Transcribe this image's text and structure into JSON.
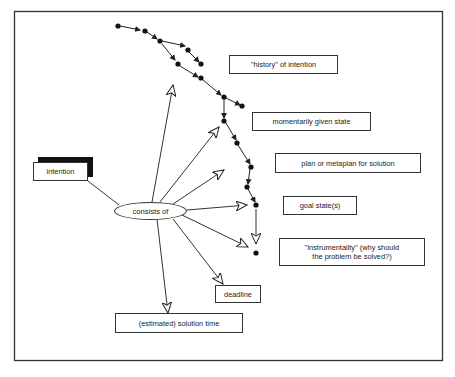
{
  "diagram": {
    "central_node": "consists of",
    "source_node": "intention",
    "components": [
      {
        "id": "history",
        "label": "\"history\" of intention"
      },
      {
        "id": "momentary",
        "label": "momentarily given state"
      },
      {
        "id": "plan",
        "label": "plan or metaplan for solution"
      },
      {
        "id": "goal",
        "label": "goal state(s)"
      },
      {
        "id": "instrumentality",
        "label": "\"instrumentality\" (why should the problem be solved?)",
        "line1": "\"instrumentality\" (why should",
        "line2": "the problem be solved?)"
      },
      {
        "id": "deadline",
        "label": "deadline"
      },
      {
        "id": "solution_time",
        "label": "(estimated) solution time"
      }
    ],
    "state_path_dots": [
      [
        118,
        26
      ],
      [
        145,
        31
      ],
      [
        160,
        41
      ],
      [
        188,
        50
      ],
      [
        201,
        64
      ],
      [
        178,
        64
      ],
      [
        201,
        78
      ],
      [
        224,
        97
      ],
      [
        242,
        106
      ],
      [
        224,
        121
      ],
      [
        237,
        143
      ],
      [
        251,
        167
      ],
      [
        247,
        187
      ],
      [
        256,
        205
      ],
      [
        256,
        253
      ]
    ],
    "colors": {
      "line": "#333333",
      "shadow": "#111111",
      "background": "#ffffff"
    }
  }
}
